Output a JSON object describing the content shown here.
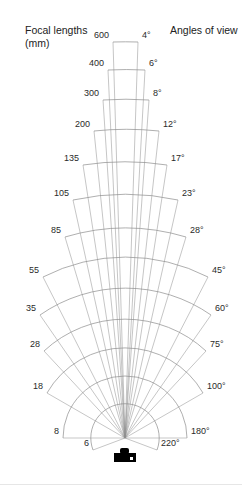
{
  "header": {
    "left_title_line1": "Focal lengths",
    "left_title_line2": "(mm)",
    "right_title": "Angles of view"
  },
  "diagram": {
    "apex": [
      125,
      438
    ],
    "colors": {
      "lines": "#8c8c8c",
      "text": "#2a2a2a",
      "camera": "#000000"
    },
    "entries": [
      {
        "focal": "600",
        "angle": "4°",
        "left": [
          113,
          42
        ],
        "right": [
          138,
          42
        ]
      },
      {
        "focal": "400",
        "angle": "6°",
        "left": [
          108,
          70
        ],
        "right": [
          145,
          70
        ]
      },
      {
        "focal": "300",
        "angle": "8°",
        "left": [
          103,
          100
        ],
        "right": [
          149,
          100
        ]
      },
      {
        "focal": "200",
        "angle": "12°",
        "left": [
          94,
          131
        ],
        "right": [
          159,
          131
        ]
      },
      {
        "focal": "135",
        "angle": "17°",
        "left": [
          83,
          165
        ],
        "right": [
          167,
          165
        ]
      },
      {
        "focal": "105",
        "angle": "23°",
        "left": [
          73,
          200
        ],
        "right": [
          178,
          200
        ]
      },
      {
        "focal": "85",
        "angle": "28°",
        "left": [
          65,
          237
        ],
        "right": [
          186,
          237
        ]
      },
      {
        "focal": "55",
        "angle": "45°",
        "left": [
          43,
          277
        ],
        "right": [
          208,
          277
        ]
      },
      {
        "focal": "35",
        "angle": "60°",
        "left": [
          40,
          315
        ],
        "right": [
          211,
          315
        ]
      },
      {
        "focal": "28",
        "angle": "75°",
        "left": [
          44,
          351
        ],
        "right": [
          206,
          351
        ]
      },
      {
        "focal": "18",
        "angle": "100°",
        "left": [
          47,
          393
        ],
        "right": [
          203,
          393
        ]
      },
      {
        "focal": "8",
        "angle": "180°",
        "left": [
          63,
          438
        ],
        "right": [
          187,
          438
        ]
      },
      {
        "focal": "6",
        "angle": "220°",
        "left": [
          93,
          450
        ],
        "right": [
          157,
          450
        ]
      }
    ],
    "camera_icon": "camera-icon"
  }
}
